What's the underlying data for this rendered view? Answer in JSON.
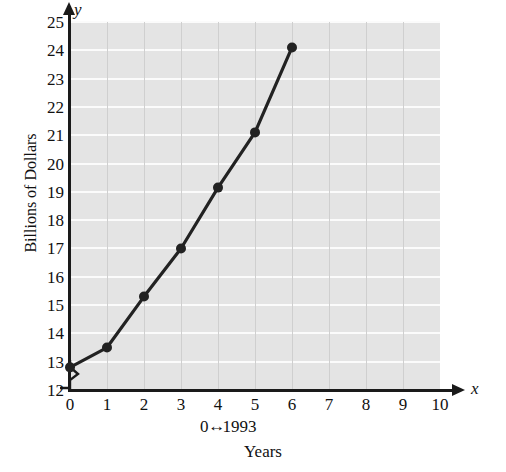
{
  "chart_data": {
    "type": "line",
    "title": "",
    "xlabel": "Years",
    "ylabel": "Billions of Dollars",
    "x": [
      0,
      1,
      2,
      3,
      4,
      5,
      6
    ],
    "values": [
      12.8,
      13.5,
      15.3,
      17.0,
      19.15,
      21.1,
      24.1
    ],
    "series": [
      {
        "name": "Billions of Dollars",
        "values": [
          12.8,
          13.5,
          15.3,
          17.0,
          19.15,
          21.1,
          24.1
        ]
      }
    ],
    "xlim": [
      0,
      10
    ],
    "ylim": [
      12,
      25
    ],
    "y_axis_break": true,
    "y_axis_break_below": 12,
    "grid": true,
    "legend": "none",
    "marker": "filled-circle",
    "line_color": "#222222",
    "plot_background": "#e4e4e4",
    "gridline_color_horizontal": "#fbfbfb",
    "gridline_color_vertical": "#cfcfcf",
    "x_tick_labels": [
      "0",
      "1",
      "2",
      "3",
      "4",
      "5",
      "6",
      "7",
      "8",
      "9",
      "10"
    ],
    "y_tick_labels": [
      "12",
      "13",
      "14",
      "15",
      "16",
      "17",
      "18",
      "19",
      "20",
      "21",
      "22",
      "23",
      "24",
      "25"
    ],
    "annotations": [
      {
        "name": "origin-year-note",
        "text": "0↔ 1993",
        "text_left": "0",
        "text_right": "1993",
        "arrow": "↔"
      }
    ]
  },
  "axes": {
    "x_symbol": "x",
    "y_symbol": "y"
  }
}
